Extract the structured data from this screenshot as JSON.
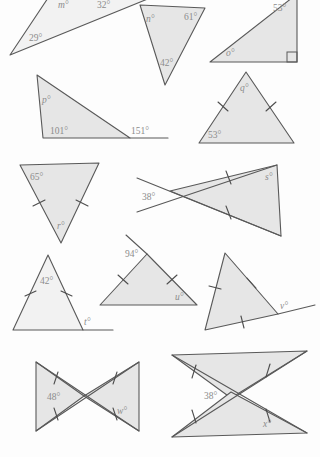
{
  "worksheet": {
    "title": "Angles in triangles worksheet",
    "background_color": "#fdfdfd",
    "shape_fill": "#e6e6e6",
    "shape_stroke": "#595959",
    "label_color": "#8c8c8c"
  },
  "figures": [
    {
      "id": "figure-a",
      "name": "scalene-triangle-m",
      "unknown": "m",
      "labels": [
        {
          "key": "m",
          "text": "m°"
        },
        {
          "key": "a32",
          "text": "32°"
        },
        {
          "key": "a29",
          "text": "29°"
        }
      ],
      "tick_marks": 0,
      "right_angle": false
    },
    {
      "id": "figure-b",
      "name": "scalene-triangle-n",
      "unknown": "n",
      "labels": [
        {
          "key": "n",
          "text": "n°"
        },
        {
          "key": "a61",
          "text": "61°"
        },
        {
          "key": "a42",
          "text": "42°"
        }
      ],
      "tick_marks": 0,
      "right_angle": false
    },
    {
      "id": "figure-c",
      "name": "right-triangle-o",
      "unknown": "o",
      "labels": [
        {
          "key": "a53",
          "text": "53°"
        },
        {
          "key": "o",
          "text": "o°"
        }
      ],
      "tick_marks": 0,
      "right_angle": true
    },
    {
      "id": "figure-d",
      "name": "triangle-p-exterior",
      "unknown": "p",
      "labels": [
        {
          "key": "p",
          "text": "p°"
        },
        {
          "key": "a101",
          "text": "101°"
        },
        {
          "key": "a151",
          "text": "151°"
        }
      ],
      "tick_marks": 0,
      "right_angle": false
    },
    {
      "id": "figure-e",
      "name": "isosceles-triangle-q",
      "unknown": "q",
      "labels": [
        {
          "key": "q",
          "text": "q°"
        },
        {
          "key": "a53",
          "text": "53°"
        }
      ],
      "tick_marks": 2,
      "right_angle": false
    },
    {
      "id": "figure-f",
      "name": "isosceles-triangle-r",
      "unknown": "r",
      "labels": [
        {
          "key": "a65",
          "text": "65°"
        },
        {
          "key": "r",
          "text": "r°"
        }
      ],
      "tick_marks": 2,
      "right_angle": false
    },
    {
      "id": "figure-g",
      "name": "crossed-lines-isosceles-s",
      "unknown": "s",
      "labels": [
        {
          "key": "a38",
          "text": "38°"
        },
        {
          "key": "s",
          "text": "s°"
        }
      ],
      "tick_marks": 2,
      "right_angle": false
    },
    {
      "id": "figure-h",
      "name": "isosceles-triangle-t-exterior",
      "unknown": "t",
      "labels": [
        {
          "key": "a42",
          "text": "42°"
        },
        {
          "key": "t",
          "text": "t°"
        }
      ],
      "tick_marks": 2,
      "right_angle": false
    },
    {
      "id": "figure-i",
      "name": "isosceles-triangle-u",
      "unknown": "u",
      "labels": [
        {
          "key": "a94",
          "text": "94°"
        },
        {
          "key": "u",
          "text": "u°"
        }
      ],
      "tick_marks": 2,
      "right_angle": false
    },
    {
      "id": "figure-j",
      "name": "equilateral-triangle-v-exterior",
      "unknown": "v",
      "labels": [
        {
          "key": "v",
          "text": "v°"
        }
      ],
      "tick_marks": 3,
      "right_angle": false
    },
    {
      "id": "figure-k",
      "name": "bowtie-triangles-w",
      "unknown": "w",
      "labels": [
        {
          "key": "a48",
          "text": "48°"
        },
        {
          "key": "w",
          "text": "w°"
        }
      ],
      "tick_marks": 4,
      "right_angle": false
    },
    {
      "id": "figure-l",
      "name": "crossed-triangles-x",
      "unknown": "x",
      "labels": [
        {
          "key": "a38",
          "text": "38°"
        },
        {
          "key": "x",
          "text": "x°"
        }
      ],
      "tick_marks": 4,
      "right_angle": false
    }
  ]
}
